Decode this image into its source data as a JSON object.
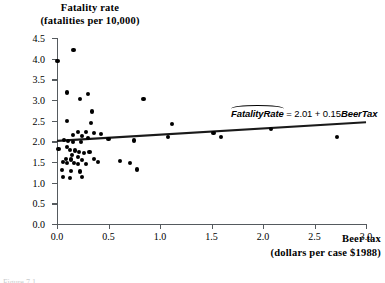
{
  "titles": {
    "y_title_line1": "Fatality rate",
    "y_title_line2": "(fatalities per 10,000)",
    "x_title_line1": "Beer tax",
    "x_title_line2": "(dollars per case $1988)"
  },
  "annotation": {
    "lhs": "FatalityRate",
    "operator": "=",
    "intercept": "2.01",
    "plus": "+",
    "slope": "0.15",
    "rhs": "BeerTax",
    "full_text": "FatalityRate = 2.01 + 0.15BeerTax"
  },
  "caption_cut": "Figure 7.1",
  "colors": {
    "axis": "#555a5e",
    "point": "#000000",
    "fit_line": "#1a1a1a",
    "background": "#ffffff"
  },
  "chart_data": {
    "type": "scatter",
    "title": "Fatality rate (fatalities per 10,000)",
    "xlabel": "Beer tax (dollars per case $1988)",
    "ylabel": "Fatality rate (fatalities per 10,000)",
    "xlim": [
      0.0,
      3.0
    ],
    "ylim": [
      0.0,
      4.5
    ],
    "xticks": [
      "0.0",
      "0.5",
      "1.0",
      "1.5",
      "2.0",
      "2.5",
      "3.0"
    ],
    "yticks": [
      "0.0",
      "0.5",
      "1.0",
      "1.5",
      "2.0",
      "2.5",
      "3.0",
      "3.5",
      "4.0",
      "4.5"
    ],
    "xtick_values": [
      0.0,
      0.5,
      1.0,
      1.5,
      2.0,
      2.5,
      3.0
    ],
    "ytick_values": [
      0.0,
      0.5,
      1.0,
      1.5,
      2.0,
      2.5,
      3.0,
      3.5,
      4.0,
      4.5
    ],
    "grid": false,
    "legend": "none",
    "series": [
      {
        "name": "States",
        "marker": "filled-circle",
        "points": [
          [
            0.005,
            3.95
          ],
          [
            0.16,
            4.2
          ],
          [
            0.1,
            3.18
          ],
          [
            0.3,
            3.15
          ],
          [
            0.22,
            3.02
          ],
          [
            0.34,
            2.72
          ],
          [
            0.1,
            2.5
          ],
          [
            0.33,
            2.44
          ],
          [
            0.28,
            2.23
          ],
          [
            0.2,
            2.22
          ],
          [
            0.36,
            2.21
          ],
          [
            0.43,
            2.18
          ],
          [
            0.155,
            2.15
          ],
          [
            0.245,
            2.12
          ],
          [
            0.3,
            2.09
          ],
          [
            0.07,
            2.03
          ],
          [
            0.105,
            2.0
          ],
          [
            0.155,
            1.99
          ],
          [
            0.235,
            1.98
          ],
          [
            0.5,
            2.05
          ],
          [
            0.75,
            2.02
          ],
          [
            1.08,
            2.1
          ],
          [
            1.12,
            2.42
          ],
          [
            0.84,
            3.03
          ],
          [
            0.015,
            1.82
          ],
          [
            0.1,
            1.86
          ],
          [
            0.125,
            1.8
          ],
          [
            0.175,
            1.78
          ],
          [
            0.215,
            1.74
          ],
          [
            0.26,
            1.72
          ],
          [
            0.145,
            1.66
          ],
          [
            0.205,
            1.62
          ],
          [
            0.09,
            1.58
          ],
          [
            0.135,
            1.56
          ],
          [
            0.24,
            1.55
          ],
          [
            0.315,
            1.74
          ],
          [
            0.36,
            1.58
          ],
          [
            0.055,
            1.5
          ],
          [
            0.1,
            1.48
          ],
          [
            0.165,
            1.47
          ],
          [
            0.205,
            1.45
          ],
          [
            0.285,
            1.46
          ],
          [
            0.4,
            1.5
          ],
          [
            0.61,
            1.53
          ],
          [
            0.71,
            1.48
          ],
          [
            0.78,
            1.32
          ],
          [
            0.045,
            1.3
          ],
          [
            0.135,
            1.28
          ],
          [
            0.225,
            1.27
          ],
          [
            0.055,
            1.13
          ],
          [
            0.125,
            1.11
          ],
          [
            0.245,
            1.13
          ],
          [
            1.52,
            2.21
          ],
          [
            1.59,
            2.11
          ],
          [
            2.08,
            2.29
          ],
          [
            2.72,
            2.11
          ]
        ]
      }
    ],
    "fit_line": {
      "label": "OLS regression line",
      "intercept": 2.01,
      "slope": 0.15,
      "x_start": 0.0,
      "x_end": 3.0,
      "y_start": 2.01,
      "y_end": 2.46
    }
  }
}
